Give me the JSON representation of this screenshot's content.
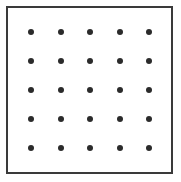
{
  "figure": {
    "canvas": {
      "width": 181,
      "height": 182,
      "background_color": "#ffffff"
    },
    "frame": {
      "shape": "rectangle",
      "stroke_color": "#3a3a3a",
      "stroke_width": 2,
      "fill_color": "#ffffff",
      "left": 6,
      "top": 6,
      "width": 167,
      "height": 168
    },
    "dot_grid": {
      "rows": 5,
      "columns": 5,
      "total_dots": 25,
      "dot_color": "#2b2b2b",
      "dot_diameter": 6,
      "dot_shape": "circle",
      "spacing_x": 29.5,
      "spacing_y": 29,
      "first_dot_center_x": 31,
      "first_dot_center_y": 32,
      "last_dot_center_x": 149,
      "last_dot_center_y": 148
    }
  },
  "chart_data": {
    "type": "scatter",
    "title": "",
    "xlabel": "",
    "ylabel": "",
    "grid": false,
    "legend": "none",
    "xlim": [
      0,
      4
    ],
    "ylim": [
      0,
      4
    ],
    "marker": "circle",
    "marker_color": "#2b2b2b",
    "marker_size": 6,
    "x": [
      0,
      1,
      2,
      3,
      4,
      0,
      1,
      2,
      3,
      4,
      0,
      1,
      2,
      3,
      4,
      0,
      1,
      2,
      3,
      4,
      0,
      1,
      2,
      3,
      4
    ],
    "y": [
      4,
      4,
      4,
      4,
      4,
      3,
      3,
      3,
      3,
      3,
      2,
      2,
      2,
      2,
      2,
      1,
      1,
      1,
      1,
      1,
      0,
      0,
      0,
      0,
      0
    ],
    "rows": [
      {
        "row_index": 0,
        "dots": 5
      },
      {
        "row_index": 1,
        "dots": 5
      },
      {
        "row_index": 2,
        "dots": 5
      },
      {
        "row_index": 3,
        "dots": 5
      },
      {
        "row_index": 4,
        "dots": 5
      }
    ]
  }
}
